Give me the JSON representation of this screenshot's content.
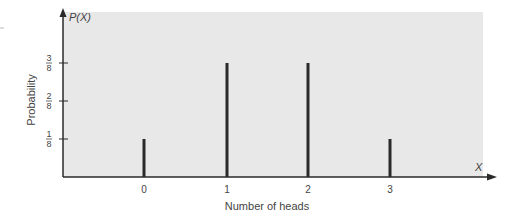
{
  "chart_data": {
    "type": "bar",
    "title": "",
    "xlabel": "Number of heads",
    "ylabel": "Probability",
    "x_axis_symbol": "X",
    "y_axis_symbol": "P(X)",
    "categories": [
      "0",
      "1",
      "2",
      "3"
    ],
    "values": [
      0.125,
      0.375,
      0.375,
      0.125
    ],
    "value_labels": [
      "1/8",
      "3/8",
      "3/8",
      "1/8"
    ],
    "y_ticks": [
      {
        "num": "1",
        "den": "8",
        "value": 0.125
      },
      {
        "num": "2",
        "den": "8",
        "value": 0.25
      },
      {
        "num": "3",
        "den": "8",
        "value": 0.375
      }
    ],
    "ylim": [
      0,
      0.5
    ],
    "grid": false,
    "legend": "none",
    "colors": {
      "plot_background": "#e8e8e8",
      "bars": "#2a2a2a",
      "axes": "#2a2a2a"
    }
  }
}
